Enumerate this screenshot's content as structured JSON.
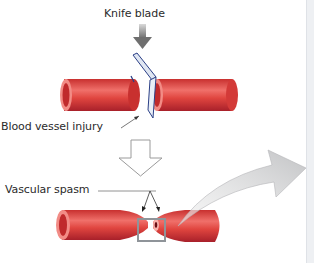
{
  "figure": {
    "top_fragment": "",
    "labels": {
      "knife_blade": "Knife blade",
      "blood_vessel_injury": "Blood vessel injury",
      "vascular_spasm": "Vascular spasm"
    },
    "colors": {
      "vessel": "#e0453f",
      "vessel_dark": "#b8262a",
      "vessel_light": "#f07b73",
      "blade": "#dfe6f2",
      "blade_edge": "#2b3f86",
      "arrow_gray": "#7a7a7a",
      "curved_arrow": "#c8c9cb"
    }
  }
}
